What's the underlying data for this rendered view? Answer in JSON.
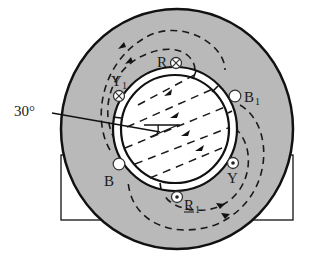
{
  "diagram": {
    "title": "",
    "angle_label": "30°",
    "colors": {
      "stator": "#b9b9b9",
      "line": "#111111",
      "background": "#ffffff",
      "rotor": "#ffffff"
    },
    "conductors": [
      {
        "id": "R",
        "label": "R",
        "subscript": "",
        "symbol": "cross",
        "x": 176,
        "y": 63
      },
      {
        "id": "Y1",
        "label": "Y",
        "subscript": "1",
        "symbol": "cross",
        "x": 119,
        "y": 96
      },
      {
        "id": "B1",
        "label": "B",
        "subscript": "1",
        "symbol": "empty",
        "x": 235,
        "y": 96
      },
      {
        "id": "B",
        "label": "B",
        "subscript": "",
        "symbol": "empty",
        "x": 119,
        "y": 164
      },
      {
        "id": "Y",
        "label": "Y",
        "subscript": "",
        "symbol": "dot",
        "x": 233,
        "y": 163
      },
      {
        "id": "R1",
        "label": "R",
        "subscript": "1",
        "symbol": "dot",
        "x": 177,
        "y": 197
      }
    ]
  }
}
